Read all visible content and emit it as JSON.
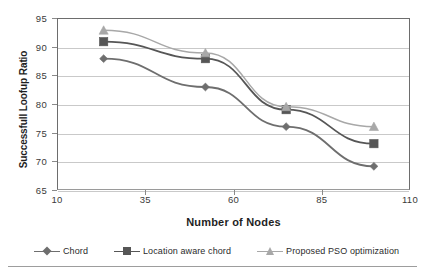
{
  "chart_data": {
    "type": "line",
    "title": "",
    "xlabel": "Number of Nodes",
    "ylabel": "Successfull Loofup Ratio",
    "x": [
      23,
      52,
      75,
      100
    ],
    "xlim": [
      10,
      110
    ],
    "ylim": [
      65,
      95
    ],
    "xticks": [
      "10",
      "35",
      "60",
      "85",
      "110"
    ],
    "xtick_values": [
      10,
      35,
      60,
      85,
      110
    ],
    "yticks": [
      "65",
      "70",
      "75",
      "80",
      "85",
      "90",
      "95"
    ],
    "ytick_values": [
      65,
      70,
      75,
      80,
      85,
      90,
      95
    ],
    "grid": "horizontal",
    "legend_position": "bottom",
    "series": [
      {
        "name": "Chord",
        "marker": "diamond",
        "color": "#6e6e6e",
        "values": [
          88,
          83,
          76,
          69
        ]
      },
      {
        "name": "Location aware chord",
        "marker": "square",
        "color": "#565656",
        "values": [
          91,
          88,
          79,
          73
        ]
      },
      {
        "name": "Proposed PSO optimization",
        "marker": "triangle",
        "color": "#a8a8a8",
        "values": [
          93,
          89,
          79.5,
          76
        ]
      }
    ]
  },
  "legend": {
    "items": [
      {
        "label": "Chord",
        "marker": "diamond-marker",
        "color": "#6e6e6e"
      },
      {
        "label": "Location aware chord",
        "marker": "square-marker",
        "color": "#565656"
      },
      {
        "label": "Proposed PSO optimization",
        "marker": "triangle-marker",
        "color": "#a8a8a8"
      }
    ]
  }
}
